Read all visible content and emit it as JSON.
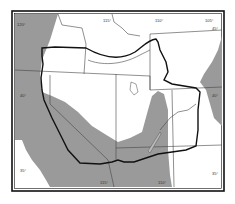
{
  "map": {
    "colors": {
      "land_shaded": "#9a9a9a",
      "land_white": "#ffffff",
      "outline": "#111111",
      "boundary": "#444444",
      "frame": "#111111"
    },
    "labels": {
      "top_lon_1": "115°",
      "top_lon_2": "110°",
      "top_lon_3": "105°",
      "right_lat_top": "45°",
      "left_lat": "40°",
      "right_lat": "40°",
      "left_lat_bottom": "35°",
      "right_lat_bottom": "35°",
      "bottom_lon_1": "115°",
      "bottom_lon_2": "110°",
      "left_lon": "120°"
    }
  }
}
